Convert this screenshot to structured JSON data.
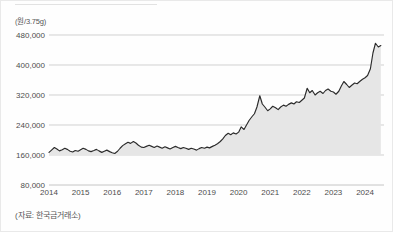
{
  "figure": {
    "unit_label": "(원/3.75g)",
    "source_note": "(자료: 한국금거래소)"
  },
  "colors": {
    "line": "#2b2b2b",
    "fill": "#e6e6e6",
    "grid": "#bfbfbf",
    "text": "#4d4d4d",
    "background": "#ffffff"
  },
  "chart_data": {
    "type": "line",
    "title": "",
    "subtitle": "",
    "xlabel": "",
    "ylabel": "(원/3.75g)",
    "source": "(자료: 한국금거래소)",
    "grid": true,
    "legend": false,
    "legend_position": "none",
    "fill_area": true,
    "fill_baseline": 160000,
    "xlim": [
      2014.0,
      2024.6
    ],
    "ylim": [
      80000,
      480000
    ],
    "ytick_labels": [
      "480,000",
      "400,000",
      "320,000",
      "240,000",
      "160,000",
      "80,000"
    ],
    "yticks": [
      480000,
      400000,
      320000,
      240000,
      160000,
      80000
    ],
    "xtick_labels": [
      "2014",
      "2015",
      "2016",
      "2017",
      "2018",
      "2019",
      "2020",
      "2021",
      "2022",
      "2023",
      "2024"
    ],
    "xticks": [
      2014,
      2015,
      2016,
      2017,
      2018,
      2019,
      2020,
      2021,
      2022,
      2023,
      2024
    ],
    "series": [
      {
        "name": "금 가격",
        "x": [
          2014.0,
          2014.08,
          2014.17,
          2014.25,
          2014.33,
          2014.42,
          2014.5,
          2014.58,
          2014.67,
          2014.75,
          2014.83,
          2014.92,
          2015.0,
          2015.08,
          2015.17,
          2015.25,
          2015.33,
          2015.42,
          2015.5,
          2015.58,
          2015.67,
          2015.75,
          2015.83,
          2015.92,
          2016.0,
          2016.08,
          2016.17,
          2016.25,
          2016.33,
          2016.42,
          2016.5,
          2016.58,
          2016.67,
          2016.75,
          2016.83,
          2016.92,
          2017.0,
          2017.08,
          2017.17,
          2017.25,
          2017.33,
          2017.42,
          2017.5,
          2017.58,
          2017.67,
          2017.75,
          2017.83,
          2017.92,
          2018.0,
          2018.08,
          2018.17,
          2018.25,
          2018.33,
          2018.42,
          2018.5,
          2018.58,
          2018.67,
          2018.75,
          2018.83,
          2018.92,
          2019.0,
          2019.08,
          2019.17,
          2019.25,
          2019.33,
          2019.42,
          2019.5,
          2019.58,
          2019.67,
          2019.75,
          2019.83,
          2019.92,
          2020.0,
          2020.08,
          2020.17,
          2020.25,
          2020.33,
          2020.42,
          2020.5,
          2020.58,
          2020.67,
          2020.75,
          2020.83,
          2020.92,
          2021.0,
          2021.08,
          2021.17,
          2021.25,
          2021.33,
          2021.42,
          2021.5,
          2021.58,
          2021.67,
          2021.75,
          2021.83,
          2021.92,
          2022.0,
          2022.08,
          2022.17,
          2022.25,
          2022.33,
          2022.42,
          2022.5,
          2022.58,
          2022.67,
          2022.75,
          2022.83,
          2022.92,
          2023.0,
          2023.08,
          2023.17,
          2023.25,
          2023.33,
          2023.42,
          2023.5,
          2023.58,
          2023.67,
          2023.75,
          2023.83,
          2023.92,
          2024.0,
          2024.08,
          2024.17,
          2024.25,
          2024.33,
          2024.42,
          2024.5
        ],
        "values": [
          167000,
          173000,
          180000,
          176000,
          171000,
          174000,
          178000,
          175000,
          170000,
          168000,
          172000,
          170000,
          174000,
          178000,
          175000,
          171000,
          169000,
          172000,
          175000,
          171000,
          167000,
          170000,
          173000,
          169000,
          166000,
          164000,
          170000,
          178000,
          185000,
          190000,
          194000,
          191000,
          196000,
          192000,
          186000,
          181000,
          180000,
          183000,
          186000,
          183000,
          180000,
          184000,
          181000,
          178000,
          182000,
          179000,
          176000,
          180000,
          183000,
          180000,
          177000,
          180000,
          178000,
          175000,
          178000,
          176000,
          173000,
          177000,
          180000,
          178000,
          181000,
          179000,
          183000,
          186000,
          190000,
          196000,
          203000,
          212000,
          218000,
          214000,
          219000,
          216000,
          221000,
          235000,
          228000,
          240000,
          252000,
          262000,
          270000,
          288000,
          318000,
          296000,
          288000,
          278000,
          283000,
          290000,
          286000,
          281000,
          288000,
          293000,
          290000,
          295000,
          299000,
          296000,
          302000,
          300000,
          306000,
          312000,
          338000,
          326000,
          332000,
          320000,
          326000,
          330000,
          324000,
          332000,
          336000,
          330000,
          328000,
          322000,
          330000,
          344000,
          356000,
          348000,
          340000,
          346000,
          352000,
          350000,
          356000,
          362000,
          366000,
          372000,
          390000,
          432000,
          458000,
          448000,
          452000
        ]
      }
    ],
    "annotations": [],
    "notes": {
      "start_value": 167000,
      "peak_value": 458000,
      "end_value": 452000,
      "units": "원 per 3.75g"
    }
  }
}
